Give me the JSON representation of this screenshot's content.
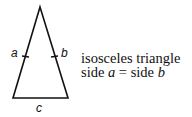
{
  "figure": {
    "type": "isosceles-triangle",
    "side_labels": {
      "left": "a",
      "right": "b",
      "base": "c"
    },
    "caption": {
      "line1": "isosceles triangle",
      "line2_prefix": "side ",
      "line2_var1": "a",
      "line2_eq": " = side ",
      "line2_var2": "b"
    },
    "colors": {
      "stroke": "#111111",
      "background": "#ffffff"
    }
  }
}
